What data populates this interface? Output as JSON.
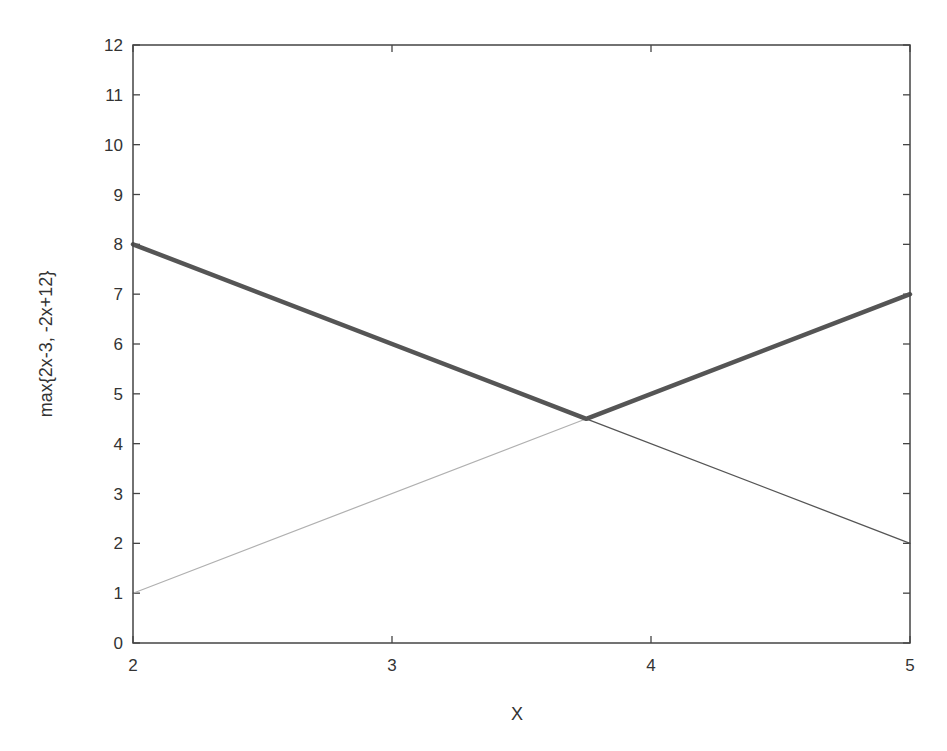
{
  "chart_data": {
    "type": "line",
    "title": "",
    "xlabel": "X",
    "ylabel": "max{2x-3, -2x+12}",
    "xlim": [
      2,
      5
    ],
    "ylim": [
      0,
      12
    ],
    "grid": false,
    "legend": null,
    "x_ticks": [
      2,
      3,
      4,
      5
    ],
    "y_ticks": [
      0,
      1,
      2,
      3,
      4,
      5,
      6,
      7,
      8,
      9,
      10,
      11,
      12
    ],
    "series": [
      {
        "name": "max{2x-3, -2x+12}",
        "style": "thick-dark",
        "color": "#555555",
        "x": [
          2,
          3.75,
          5
        ],
        "y": [
          8,
          4.5,
          7
        ]
      },
      {
        "name": "-2x+12",
        "style": "thin-dark",
        "color": "#555555",
        "x": [
          3.75,
          5
        ],
        "y": [
          4.5,
          2
        ]
      },
      {
        "name": "2x-3",
        "style": "thin-light",
        "color": "#b0b0b0",
        "x": [
          2,
          3.75
        ],
        "y": [
          1,
          4.5
        ]
      }
    ],
    "intersection": {
      "x": 3.75,
      "y": 4.5
    }
  },
  "colors": {
    "frame": "#444444",
    "text": "#333333",
    "background": "#ffffff"
  }
}
